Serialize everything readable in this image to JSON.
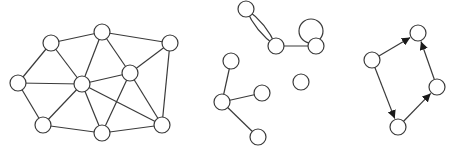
{
  "style": {
    "line_color": "#3a3a3a",
    "node_fill": "#ffffff",
    "node_radius": 8
  },
  "graphs": [
    {
      "name": "undirected-planar-graph",
      "nodes": [
        {
          "id": "A",
          "x": 51,
          "y": 43
        },
        {
          "id": "B",
          "x": 102,
          "y": 32
        },
        {
          "id": "C",
          "x": 170,
          "y": 43
        },
        {
          "id": "D",
          "x": 18,
          "y": 83
        },
        {
          "id": "E",
          "x": 82,
          "y": 84
        },
        {
          "id": "F",
          "x": 130,
          "y": 73
        },
        {
          "id": "G",
          "x": 43,
          "y": 125
        },
        {
          "id": "H",
          "x": 102,
          "y": 133
        },
        {
          "id": "I",
          "x": 162,
          "y": 125
        }
      ],
      "edges": [
        [
          "A",
          "B"
        ],
        [
          "B",
          "C"
        ],
        [
          "A",
          "D"
        ],
        [
          "A",
          "E"
        ],
        [
          "D",
          "E"
        ],
        [
          "D",
          "G"
        ],
        [
          "G",
          "E"
        ],
        [
          "G",
          "H"
        ],
        [
          "E",
          "H"
        ],
        [
          "B",
          "E"
        ],
        [
          "B",
          "F"
        ],
        [
          "E",
          "F"
        ],
        [
          "F",
          "C"
        ],
        [
          "C",
          "I"
        ],
        [
          "F",
          "I"
        ],
        [
          "F",
          "H"
        ],
        [
          "E",
          "I"
        ],
        [
          "H",
          "I"
        ]
      ]
    },
    {
      "name": "multigraph-with-loop",
      "nodes": [
        {
          "id": "M1",
          "x": 246,
          "y": 9
        },
        {
          "id": "M2",
          "x": 276,
          "y": 46
        },
        {
          "id": "M3",
          "x": 316,
          "y": 46
        },
        {
          "id": "M4",
          "x": 231,
          "y": 61
        },
        {
          "id": "M5",
          "x": 222,
          "y": 102
        },
        {
          "id": "M6",
          "x": 262,
          "y": 93
        },
        {
          "id": "M7",
          "x": 301,
          "y": 82
        },
        {
          "id": "M8",
          "x": 258,
          "y": 137
        }
      ],
      "edges": [
        [
          "M2",
          "M3"
        ],
        [
          "M4",
          "M5"
        ],
        [
          "M5",
          "M6"
        ],
        [
          "M5",
          "M8"
        ]
      ],
      "multi_edges": [
        {
          "from": "M1",
          "to": "M2",
          "count": 2
        }
      ],
      "loops": [
        {
          "node": "M3",
          "cx": 311,
          "cy": 31,
          "r": 12
        }
      ]
    },
    {
      "name": "directed-cycle-graph",
      "nodes": [
        {
          "id": "R1",
          "x": 372,
          "y": 60
        },
        {
          "id": "R2",
          "x": 418,
          "y": 33
        },
        {
          "id": "R3",
          "x": 437,
          "y": 87
        },
        {
          "id": "R4",
          "x": 398,
          "y": 127
        }
      ],
      "directed_edges": [
        [
          "R1",
          "R2"
        ],
        [
          "R1",
          "R4"
        ],
        [
          "R4",
          "R3"
        ],
        [
          "R3",
          "R2"
        ]
      ]
    }
  ]
}
